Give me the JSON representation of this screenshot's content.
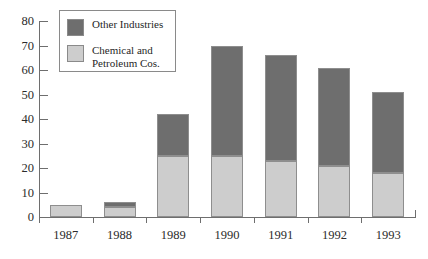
{
  "chart_data": {
    "type": "bar",
    "subtype": "stacked-vertical",
    "title": "",
    "subtitle": "",
    "xlabel": "",
    "ylabel": "",
    "categories": [
      "1987",
      "1988",
      "1989",
      "1990",
      "1991",
      "1992",
      "1993"
    ],
    "series": [
      {
        "name": "Chemical and\nPetroleum Cos.",
        "legend_label": "Chemical and Petroleum Cos.",
        "color": "#cdcdcd",
        "values": [
          5,
          4,
          25,
          25,
          23,
          21,
          18
        ]
      },
      {
        "name": "Other Industries",
        "legend_label": "Other Industries",
        "color": "#6e6e6e",
        "values": [
          0,
          2,
          17,
          45,
          43,
          40,
          33
        ]
      }
    ],
    "totals": [
      5,
      6,
      42,
      70,
      66,
      61,
      51
    ],
    "ylim": [
      0,
      80
    ],
    "yticks": [
      0,
      10,
      20,
      30,
      40,
      50,
      60,
      70,
      80
    ],
    "ytick_labels": [
      "0",
      "10",
      "20",
      "30",
      "40",
      "50",
      "60",
      "70",
      "80"
    ],
    "grid": false,
    "legend_position": "top-left-inset"
  },
  "legend": {
    "entries": [
      {
        "label": "Other Industries",
        "color": "#6e6e6e"
      },
      {
        "label": "Chemical and\nPetroleum Cos.",
        "color": "#cdcdcd"
      }
    ]
  },
  "colors": {
    "other_industries": "#6e6e6e",
    "chemical_petroleum": "#cdcdcd",
    "axis": "#6e6e6e",
    "bar_outline": "#8e8e8e",
    "text": "#2b2b2b",
    "background": "#ffffff"
  }
}
